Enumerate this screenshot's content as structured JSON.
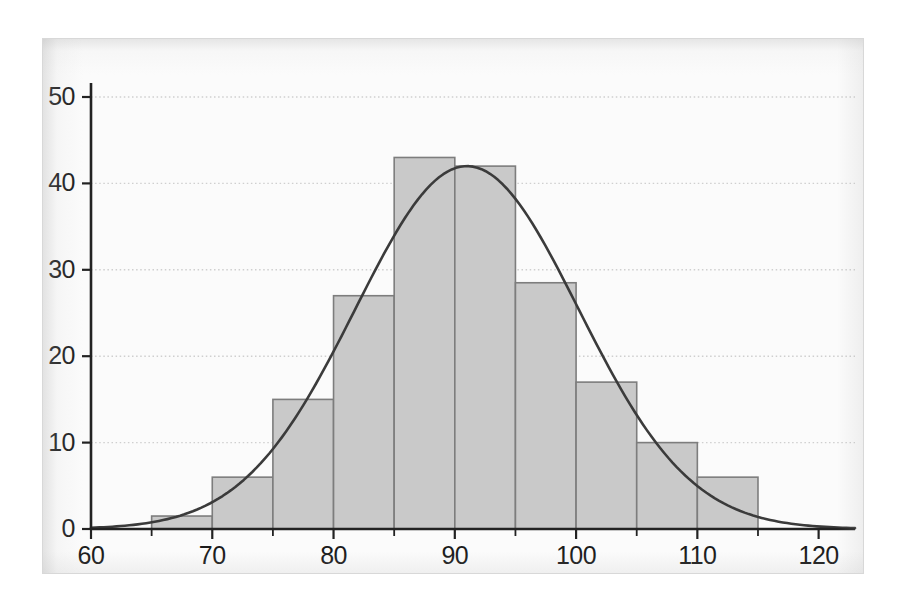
{
  "chart_data": {
    "type": "bar",
    "title": "",
    "subtitle": "",
    "xlabel": "",
    "ylabel": "",
    "xlim": [
      60,
      123
    ],
    "ylim": [
      0,
      52
    ],
    "grid": true,
    "grid_axis": "y",
    "legend": "none",
    "bin_width": 5,
    "bar_color": "#c9c9c9",
    "bar_edge_color": "#7d7d7d",
    "curve_color": "#3b3b3b",
    "axis_color": "#222222",
    "grid_color": "#cfcfcf",
    "background_color": "#fbfbfb",
    "x_ticks": [
      60,
      70,
      80,
      90,
      100,
      110,
      120
    ],
    "x_tick_labels": [
      "60",
      "70",
      "80",
      "90",
      "100",
      "110",
      "120"
    ],
    "x_minor_ticks": [
      65,
      75,
      85,
      95,
      105,
      115
    ],
    "y_ticks": [
      0,
      10,
      20,
      30,
      40,
      50
    ],
    "y_tick_labels": [
      "0",
      "10",
      "20",
      "30",
      "40",
      "50"
    ],
    "bins": [
      {
        "x0": 65,
        "x1": 70,
        "value": 1.5
      },
      {
        "x0": 70,
        "x1": 75,
        "value": 6
      },
      {
        "x0": 75,
        "x1": 80,
        "value": 15
      },
      {
        "x0": 80,
        "x1": 85,
        "value": 27
      },
      {
        "x0": 85,
        "x1": 90,
        "value": 43
      },
      {
        "x0": 90,
        "x1": 95,
        "value": 42
      },
      {
        "x0": 95,
        "x1": 100,
        "value": 28.5
      },
      {
        "x0": 100,
        "x1": 105,
        "value": 17
      },
      {
        "x0": 105,
        "x1": 110,
        "value": 10
      },
      {
        "x0": 110,
        "x1": 115,
        "value": 6
      }
    ],
    "categories": [
      "65-70",
      "70-75",
      "75-80",
      "80-85",
      "85-90",
      "90-95",
      "95-100",
      "100-105",
      "105-110",
      "110-115"
    ],
    "values": [
      1.5,
      6,
      15,
      27,
      43,
      42,
      28.5,
      17,
      10,
      6
    ],
    "overlay_curve": {
      "name": "normal-density-curve",
      "type": "line",
      "mean": 91,
      "std": 9.2,
      "peak_value": 42,
      "description": "smooth bell curve fitted over histogram"
    }
  }
}
